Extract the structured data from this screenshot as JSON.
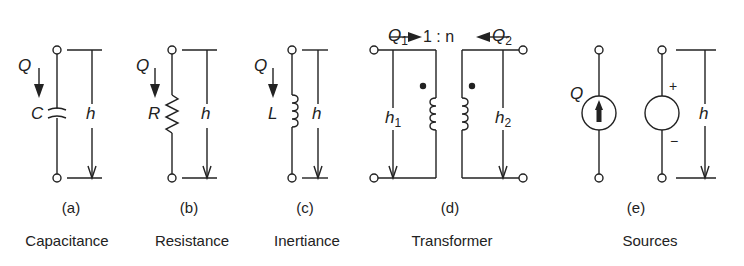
{
  "figure": {
    "panels": [
      {
        "id": "a",
        "tag": "(a)",
        "caption": "Capacitance",
        "element_symbol": "C",
        "flow_label": "Q",
        "effort_label": "h"
      },
      {
        "id": "b",
        "tag": "(b)",
        "caption": "Resistance",
        "element_symbol": "R",
        "flow_label": "Q",
        "effort_label": "h"
      },
      {
        "id": "c",
        "tag": "(c)",
        "caption": "Inertiance",
        "element_symbol": "L",
        "flow_label": "Q",
        "effort_label": "h"
      },
      {
        "id": "d",
        "tag": "(d)",
        "caption": "Transformer",
        "ratio_label": "1 : n",
        "flow_label_1": "Q",
        "flow_sub_1": "1",
        "flow_label_2": "Q",
        "flow_sub_2": "2",
        "effort_label_1": "h",
        "effort_sub_1": "1",
        "effort_label_2": "h",
        "effort_sub_2": "2"
      },
      {
        "id": "e",
        "tag": "(e)",
        "caption": "Sources",
        "flow_label": "Q",
        "effort_label": "h",
        "plus_sign": "+",
        "minus_sign": "−"
      }
    ],
    "colors": {
      "line": "#222222",
      "background": "#ffffff"
    }
  }
}
